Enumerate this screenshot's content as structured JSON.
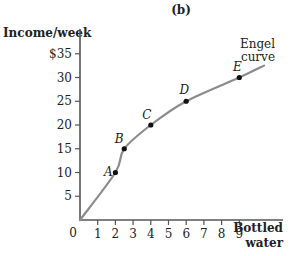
{
  "chart_data": {
    "type": "line",
    "panel_label": "(b)",
    "title": "",
    "xlabel": "Bottled water",
    "xlabel_lines": [
      "Bottled",
      "water"
    ],
    "ylabel": "Income/week",
    "xlim": [
      0,
      11
    ],
    "ylim": [
      0,
      40
    ],
    "x_ticks": [
      1,
      2,
      3,
      4,
      5,
      6,
      7,
      8,
      9
    ],
    "y_ticks": [
      5,
      10,
      15,
      20,
      25,
      30,
      35
    ],
    "y_tick_labels": [
      "5",
      "10",
      "15",
      "20",
      "25",
      "30",
      "$35"
    ],
    "origin_label": "0",
    "grid": false,
    "series": [
      {
        "name": "Engel curve",
        "name_lines": [
          "Engel",
          "curve"
        ],
        "color": "#8c8c8c",
        "x": [
          0,
          2,
          2.5,
          4,
          6,
          9,
          10.4
        ],
        "y": [
          0,
          10,
          15,
          20,
          25,
          30,
          32.5
        ]
      }
    ],
    "points": [
      {
        "label": "A",
        "x": 2,
        "y": 10
      },
      {
        "label": "B",
        "x": 2.5,
        "y": 15
      },
      {
        "label": "C",
        "x": 4,
        "y": 20
      },
      {
        "label": "D",
        "x": 6,
        "y": 25
      },
      {
        "label": "E",
        "x": 9,
        "y": 30
      }
    ],
    "colors": {
      "axis": "#555555",
      "curve": "#8c8c8c",
      "point": "#111111",
      "text": "#222222"
    }
  }
}
